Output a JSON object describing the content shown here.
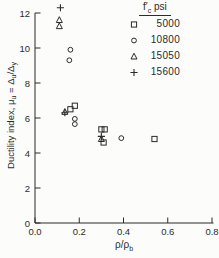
{
  "chart_data": {
    "type": "scatter",
    "title": "",
    "xlabel_parts": [
      {
        "text": "ρ/ρ",
        "sub": false
      },
      {
        "text": "b",
        "sub": true
      }
    ],
    "ylabel_parts": [
      {
        "text": "Ductility index, μ",
        "sub": false
      },
      {
        "text": "u",
        "sub": true
      },
      {
        "text": " = Δ",
        "sub": false
      },
      {
        "text": "u",
        "sub": true
      },
      {
        "text": "/Δ",
        "sub": false
      },
      {
        "text": "y",
        "sub": true
      }
    ],
    "xlim": [
      0.0,
      0.8
    ],
    "ylim": [
      0,
      12
    ],
    "xticks": [
      "0.0",
      "0.2",
      "0.4",
      "0.6",
      "0.8"
    ],
    "yticks": [
      "0",
      "2",
      "4",
      "6",
      "8",
      "10",
      "12"
    ],
    "grid": false,
    "legend": {
      "position": "top-right",
      "title_parts": [
        {
          "text": "f′",
          "sub": false
        },
        {
          "text": "c",
          "sub": true
        },
        {
          "text": " psi",
          "sub": false
        }
      ]
    },
    "series": [
      {
        "name": "5000",
        "fc_psi": 5000,
        "marker": "square",
        "marker_icon": "square-marker-icon",
        "points": [
          [
            0.18,
            6.7
          ],
          [
            0.16,
            6.5
          ],
          [
            0.3,
            5.35
          ],
          [
            0.315,
            5.35
          ],
          [
            0.31,
            4.6
          ],
          [
            0.54,
            4.8
          ]
        ]
      },
      {
        "name": "10800",
        "fc_psi": 10800,
        "marker": "circle",
        "marker_icon": "circle-marker-icon",
        "points": [
          [
            0.16,
            9.9
          ],
          [
            0.155,
            9.3
          ],
          [
            0.18,
            5.95
          ],
          [
            0.18,
            5.65
          ],
          [
            0.39,
            4.85
          ]
        ]
      },
      {
        "name": "15050",
        "fc_psi": 15050,
        "marker": "triangle",
        "marker_icon": "triangle-marker-icon",
        "points": [
          [
            0.11,
            11.6
          ],
          [
            0.11,
            11.25
          ],
          [
            0.135,
            6.35
          ],
          [
            0.3,
            4.8
          ]
        ]
      },
      {
        "name": "15600",
        "fc_psi": 15600,
        "marker": "plus",
        "marker_icon": "plus-marker-icon",
        "points": [
          [
            0.115,
            12.3
          ],
          [
            0.135,
            6.3
          ],
          [
            0.3,
            4.95
          ]
        ]
      }
    ],
    "ink_color": "#2b2b2b",
    "background_color": "#fcfcfa"
  }
}
